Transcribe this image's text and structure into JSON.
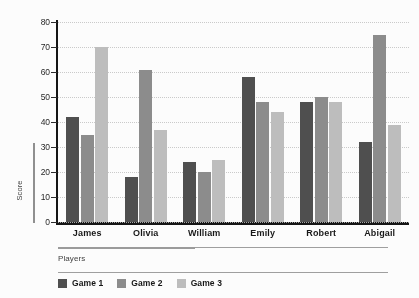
{
  "chart_data": {
    "type": "bar",
    "title": "",
    "subtitle": "",
    "xlabel": "Players",
    "ylabel": "Score",
    "categories": [
      "James",
      "Olivia",
      "William",
      "Emily",
      "Robert",
      "Abigail"
    ],
    "series": [
      {
        "name": "Game 1",
        "color": "#4d4d4d",
        "values": [
          42,
          18,
          24,
          58,
          48,
          32
        ]
      },
      {
        "name": "Game 2",
        "color": "#8b8b8b",
        "values": [
          35,
          61,
          20,
          48,
          50,
          75
        ]
      },
      {
        "name": "Game 3",
        "color": "#bdbdbd",
        "values": [
          70,
          37,
          25,
          44,
          48,
          39
        ]
      }
    ],
    "ylim": [
      0,
      80
    ],
    "yticks": [
      0,
      10,
      20,
      30,
      40,
      50,
      60,
      70,
      80
    ],
    "ytick_labels": [
      "0",
      "10",
      "20",
      "30",
      "40",
      "50",
      "60",
      "70",
      "80"
    ],
    "grid": true,
    "grid_axis": "y",
    "grid_style": "dotted",
    "legend_position": "bottom-left",
    "legend_entries": [
      "Game 1",
      "Game 2",
      "Game 3"
    ],
    "bar_group_count": 6,
    "bars_per_group": 3
  },
  "axes": {
    "y_title": "Score",
    "x_title": "Players"
  },
  "colors": {
    "series_1": "#4d4d4d",
    "series_2": "#8b8b8b",
    "series_3": "#bdbdbd",
    "axis": "#111111",
    "gridline": "#c2c2c2",
    "background": "#fdfdfd"
  }
}
